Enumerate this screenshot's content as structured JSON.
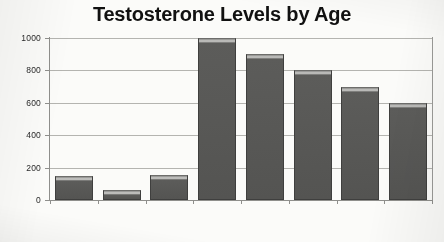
{
  "chart_data": {
    "type": "bar",
    "title": "Testosterone Levels by Age",
    "xlabel": "",
    "ylabel": "",
    "categories": [
      "Newborn",
      "Child",
      "Adolescent",
      "20-30",
      "40",
      "50",
      "60",
      "70"
    ],
    "values": [
      150,
      60,
      155,
      1000,
      900,
      800,
      700,
      600
    ],
    "ylim": [
      0,
      1000
    ],
    "yticks": [
      0,
      200,
      400,
      600,
      800,
      1000
    ],
    "ytick_labels": [
      "0",
      "200",
      "400",
      "600",
      "800",
      "1000"
    ],
    "grid": true,
    "legend": false,
    "legend_position": "none",
    "series": [
      {
        "name": "Testosterone",
        "values": [
          150,
          60,
          155,
          1000,
          900,
          800,
          700,
          600
        ]
      }
    ]
  },
  "style": {
    "background": "#fbfbf9",
    "bar_fill": "#555553",
    "bar_edge": "#3f3f3e",
    "grid_color": "#b4b4b0",
    "axis_color": "#8f8f8c",
    "text_color": "#1a1a1a"
  }
}
